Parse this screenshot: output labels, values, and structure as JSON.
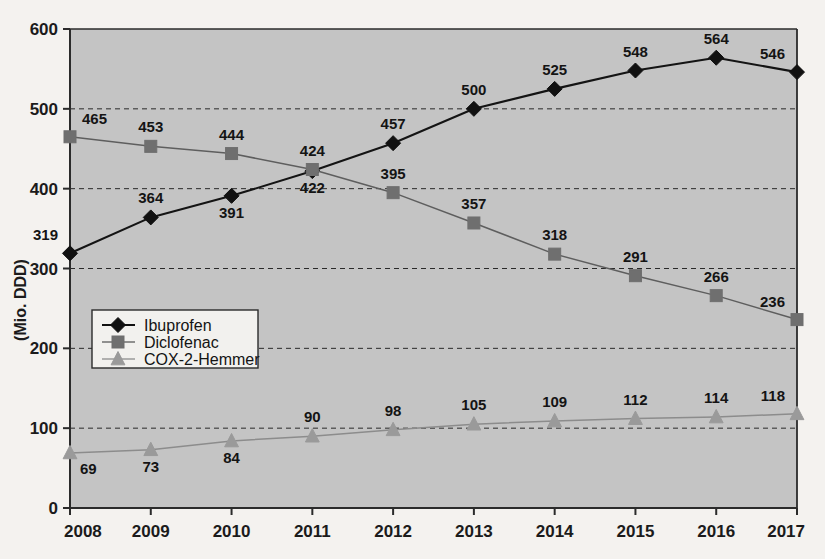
{
  "chart_data": {
    "type": "line",
    "title": "",
    "subtitle": "",
    "xlabel": "",
    "ylabel": "(Mio. DDD)",
    "categories": [
      "2008",
      "2009",
      "2010",
      "2011",
      "2012",
      "2013",
      "2014",
      "2015",
      "2016",
      "2017"
    ],
    "x": [
      2008,
      2009,
      2010,
      2011,
      2012,
      2013,
      2014,
      2015,
      2016,
      2017
    ],
    "xlim": [
      2008,
      2017
    ],
    "ylim": [
      0,
      600
    ],
    "yticks": [
      0,
      100,
      200,
      300,
      400,
      500,
      600
    ],
    "ytick_labels": [
      "0",
      "100",
      "200",
      "300",
      "400",
      "500",
      "600"
    ],
    "grid": "horizontal-dashed",
    "legend_position": "middle-left",
    "plot_background": "#c8c8c8",
    "series": [
      {
        "name": "Ibuprofen",
        "marker": "diamond",
        "color": "#111111",
        "line_color": "#141414",
        "values": [
          319,
          364,
          391,
          422,
          457,
          500,
          525,
          548,
          564,
          546
        ],
        "label_positions": [
          "above-left",
          "above",
          "below",
          "below",
          "above",
          "above",
          "above",
          "above",
          "above",
          "above-left"
        ]
      },
      {
        "name": "Diclofenac",
        "marker": "square",
        "color": "#6f6f6f",
        "line_color": "#5e5e5e",
        "values": [
          465,
          453,
          444,
          424,
          395,
          357,
          318,
          291,
          266,
          236
        ],
        "label_positions": [
          "above-right",
          "above",
          "above",
          "above",
          "above",
          "above",
          "above",
          "above",
          "above",
          "above-left"
        ]
      },
      {
        "name": "COX-2-Hemmer",
        "marker": "triangle",
        "color": "#9a9a9a",
        "line_color": "#8c8c8c",
        "values": [
          69,
          73,
          84,
          90,
          98,
          105,
          109,
          112,
          114,
          118
        ],
        "label_positions": [
          "below-right",
          "below",
          "below",
          "above",
          "above",
          "above",
          "above",
          "above",
          "above",
          "above-left"
        ]
      }
    ]
  },
  "legend": {
    "items": [
      {
        "label": "Ibuprofen",
        "marker": "diamond-icon",
        "color": "#111111"
      },
      {
        "label": "Diclofenac",
        "marker": "square-icon",
        "color": "#6f6f6f"
      },
      {
        "label": "COX-2-Hemmer",
        "marker": "triangle-icon",
        "color": "#9a9a9a"
      }
    ]
  }
}
